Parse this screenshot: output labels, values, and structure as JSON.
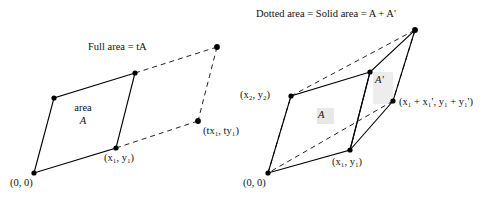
{
  "figure": {
    "title_left": "Full area = tA",
    "title_right": "Dotted area = Solid area = A + A'",
    "left": {
      "caption": "Full area = tA",
      "area_word": "area",
      "area_symbol": "A",
      "origin_label": "(0, 0)",
      "vertex_label": "(x₁, y₁)",
      "scaled_vertex_label": "(tx₁, ty₁)",
      "vertices": {
        "origin": [
          34,
          173
        ],
        "upper_left": [
          54,
          98
        ],
        "top": [
          135,
          73
        ],
        "right": [
          116,
          148
        ],
        "dashed_top": [
          217,
          47
        ],
        "dashed_right": [
          198,
          121
        ]
      }
    },
    "right": {
      "caption": "Dotted area = Solid area = A + A'",
      "area_a": "A",
      "area_a_prime": "A'",
      "origin_label": "(0, 0)",
      "v1_label": "(x₁, y₁)",
      "v2_label": "(x₂, y₂)",
      "sum_label": "(x₁ + x₁', y₁ + y₁')",
      "vertices": {
        "origin": [
          268,
          173
        ],
        "x2y2": [
          291,
          96
        ],
        "top_mid": [
          370,
          72
        ],
        "apex": [
          415,
          30
        ],
        "x1y1": [
          350,
          150
        ],
        "sum_point": [
          393,
          101
        ]
      }
    },
    "colors": {
      "stroke": "#000000",
      "dash": "#222222",
      "highlight": "#e6e6e6",
      "background": "#ffffff"
    },
    "line_styles": {
      "solid": "solid",
      "dashed": "dashed"
    }
  }
}
